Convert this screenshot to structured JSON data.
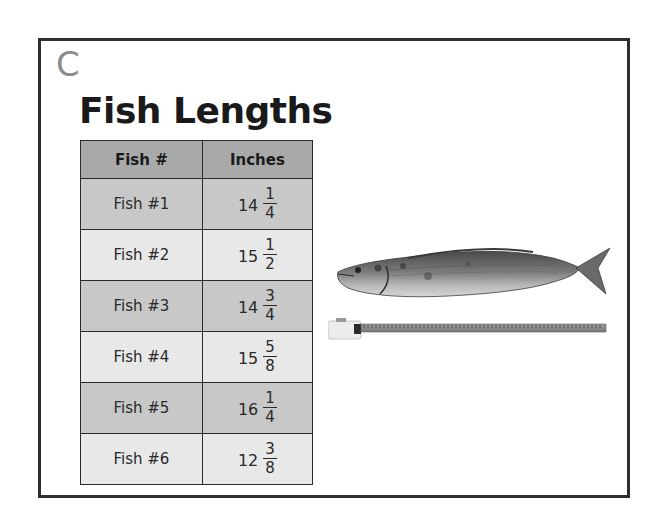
{
  "panel": {
    "label": "C",
    "title": "Fish Lengths"
  },
  "table": {
    "headers": [
      "Fish #",
      "Inches"
    ],
    "rows": [
      {
        "fish": "Fish #1",
        "whole": "14",
        "num": "1",
        "den": "4"
      },
      {
        "fish": "Fish #2",
        "whole": "15",
        "num": "1",
        "den": "2"
      },
      {
        "fish": "Fish #3",
        "whole": "14",
        "num": "3",
        "den": "4"
      },
      {
        "fish": "Fish #4",
        "whole": "15",
        "num": "5",
        "den": "8"
      },
      {
        "fish": "Fish #5",
        "whole": "16",
        "num": "1",
        "den": "4"
      },
      {
        "fish": "Fish #6",
        "whole": "12",
        "num": "3",
        "den": "8"
      }
    ]
  },
  "image": {
    "subject": "fish-with-measuring-tape"
  },
  "colors": {
    "frame_border": "#2e2e2e",
    "label": "#8c8c8c",
    "header_bg": "#a9a9a9",
    "row_dark_bg": "#c8c8c8",
    "row_light_bg": "#e8e8e8"
  }
}
